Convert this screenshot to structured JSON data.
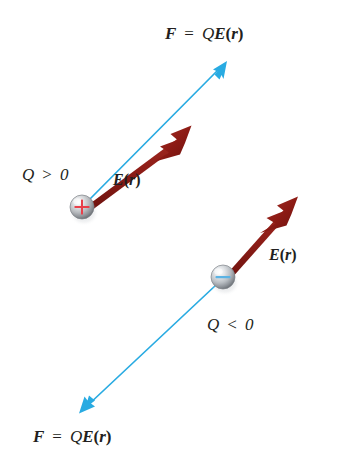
{
  "figure": {
    "background_color": "#ffffff",
    "width": 338,
    "height": 468
  },
  "colors": {
    "force_arrow": "#29ABE2",
    "field_arrow": "#8B1A1A",
    "field_arrow_light": "#A52A2A",
    "text": "#231f20",
    "plus_sign": "#E8404A",
    "minus_sign": "#5BB3E4",
    "sphere_light": "#f2f2f2",
    "sphere_mid": "#b9bcc0",
    "sphere_dark": "#6f7378"
  },
  "labels": {
    "force_top": {
      "vector_F": "F",
      "equals": "=",
      "charge_Q": "Q",
      "field_E": "E",
      "paren_open": "(",
      "position_r": "r",
      "paren_close": ")"
    },
    "force_bottom": {
      "vector_F": "F",
      "equals": "=",
      "charge_Q": "Q",
      "field_E": "E",
      "paren_open": "(",
      "position_r": "r",
      "paren_close": ")"
    },
    "field_top": {
      "field_E": "E",
      "paren_open": "(",
      "position_r": "r",
      "paren_close": ")"
    },
    "field_bottom": {
      "field_E": "E",
      "paren_open": "(",
      "position_r": "r",
      "paren_close": ")"
    },
    "charge_positive": {
      "symbol": "Q",
      "relation": ">",
      "value": "0"
    },
    "charge_negative": {
      "symbol": "Q",
      "relation": "<",
      "value": "0"
    }
  },
  "charges": {
    "positive": {
      "sign_glyph": "+",
      "center_x": 82,
      "center_y": 207,
      "radius": 12
    },
    "negative": {
      "sign_glyph": "−",
      "center_x": 223,
      "center_y": 277,
      "radius": 12
    }
  },
  "vectors": {
    "positive_force": {
      "name": "F = QE(r)",
      "from_x": 86,
      "from_y": 203,
      "to_x": 226,
      "to_y": 62,
      "color": "#29ABE2"
    },
    "positive_field": {
      "name": "E(r)",
      "from_x": 88,
      "from_y": 201,
      "to_x": 190,
      "to_y": 125,
      "color": "#8B1A1A"
    },
    "negative_field": {
      "name": "E(r)",
      "from_x": 228,
      "from_y": 272,
      "to_x": 297,
      "to_y": 196,
      "color": "#8B1A1A"
    },
    "negative_force": {
      "name": "F = QE(r)",
      "from_x": 216,
      "from_y": 285,
      "to_x": 80,
      "to_y": 413,
      "color": "#29ABE2"
    }
  }
}
